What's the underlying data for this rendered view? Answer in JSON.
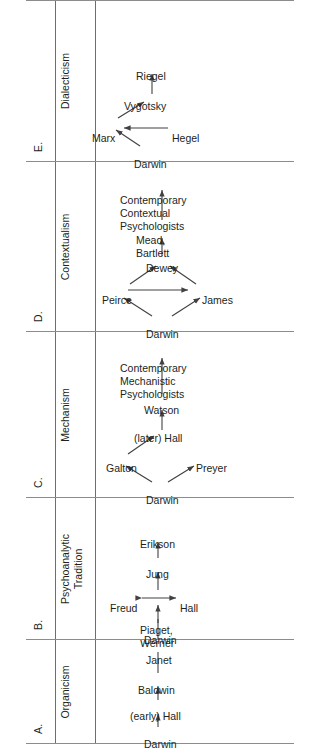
{
  "figure": {
    "kind": "lineage-diagram-table",
    "orientation": "rotated-90-ccw",
    "sections": [
      {
        "letter": "A.",
        "worldview": "Organicism",
        "nodes": [
          "Darwin",
          "(early) Hall",
          "Baldwin",
          "Janet",
          "Piaget,\nWerner"
        ],
        "edges": [
          {
            "from": "Darwin",
            "to": "(early) Hall",
            "style": "arrow"
          },
          {
            "from": "(early) Hall",
            "to": "Baldwin",
            "style": "arrow"
          },
          {
            "from": "Baldwin",
            "to": "Janet",
            "style": "line"
          },
          {
            "from": "Janet",
            "to": "Piaget, Werner",
            "style": "line"
          }
        ]
      },
      {
        "letter": "B.",
        "worldview": "Psychoanalytic\nTradition",
        "nodes": [
          "Darwin",
          "Hall",
          "Freud",
          "Jung",
          "Erikson"
        ],
        "edges": [
          {
            "from": "Darwin",
            "to": "Hall/Freud",
            "style": "arrow"
          },
          {
            "from": "Hall",
            "to": "Freud",
            "style": "double-arrow"
          },
          {
            "from": "Hall/Freud",
            "to": "Jung",
            "style": "arrow"
          },
          {
            "from": "Jung",
            "to": "Erikson",
            "style": "arrow"
          }
        ]
      },
      {
        "letter": "C.",
        "worldview": "Mechanism",
        "nodes": [
          "Darwin",
          "Galton",
          "Preyer",
          "(later) Hall",
          "Watson",
          "Contemporary\nMechanistic\nPsychologists"
        ],
        "edges": [
          {
            "from": "Darwin",
            "to": "Galton",
            "style": "arrow"
          },
          {
            "from": "Darwin",
            "to": "Preyer",
            "style": "arrow"
          },
          {
            "from": "Galton",
            "to": "(later) Hall",
            "style": "arrow"
          },
          {
            "from": "(later) Hall",
            "to": "Watson",
            "style": "arrow"
          },
          {
            "from": "Watson",
            "to": "Contemporary Mechanistic Psychologists",
            "style": "arrow"
          }
        ]
      },
      {
        "letter": "D.",
        "worldview": "Contextualism",
        "nodes": [
          "Darwin",
          "Peirce",
          "James",
          "Dewey",
          "Mead,\nBartlett",
          "Contemporary\nContextual\nPsychologists"
        ],
        "edges": [
          {
            "from": "Darwin",
            "to": "Peirce",
            "style": "arrow"
          },
          {
            "from": "Darwin",
            "to": "James",
            "style": "arrow"
          },
          {
            "from": "Peirce",
            "to": "James",
            "style": "arrow"
          },
          {
            "from": "Peirce",
            "to": "Dewey",
            "style": "arrow"
          },
          {
            "from": "James",
            "to": "Dewey",
            "style": "arrow"
          },
          {
            "from": "Dewey",
            "to": "Mead, Bartlett",
            "style": "arrow"
          },
          {
            "from": "Mead, Bartlett",
            "to": "Contemporary Contextual Psychologists",
            "style": "arrow"
          }
        ]
      },
      {
        "letter": "E.",
        "worldview": "Dialecticism",
        "nodes": [
          "Darwin",
          "Hegel",
          "Marx",
          "Vygotsky",
          "Riegel"
        ],
        "edges": [
          {
            "from": "Darwin",
            "to": "Marx",
            "style": "arrow"
          },
          {
            "from": "Hegel",
            "to": "Marx",
            "style": "arrow"
          },
          {
            "from": "Marx",
            "to": "Vygotsky",
            "style": "arrow"
          },
          {
            "from": "Vygotsky",
            "to": "Riegel",
            "style": "arrow"
          }
        ]
      }
    ]
  },
  "labels": {
    "a_letter": "A.",
    "a_worldview": "Organicism",
    "a_darwin": "Darwin",
    "a_early_hall": "(early) Hall",
    "a_baldwin": "Baldwin",
    "a_janet": "Janet",
    "a_piaget_werner_l1": "Piaget,",
    "a_piaget_werner_l2": "Werner",
    "b_letter": "B.",
    "b_worldview_l1": "Psychoanalytic",
    "b_worldview_l2": "Tradition",
    "b_darwin": "Darwin",
    "b_hall": "Hall",
    "b_freud": "Freud",
    "b_jung": "Jung",
    "b_erikson": "Erikson",
    "c_letter": "C.",
    "c_worldview": "Mechanism",
    "c_darwin": "Darwin",
    "c_galton": "Galton",
    "c_preyer": "Preyer",
    "c_later_hall": "(later) Hall",
    "c_watson": "Watson",
    "c_contemp_l1": "Contemporary",
    "c_contemp_l2": "Mechanistic",
    "c_contemp_l3": "Psychologists",
    "d_letter": "D.",
    "d_worldview": "Contextualism",
    "d_darwin": "Darwin",
    "d_peirce": "Peirce",
    "d_james": "James",
    "d_dewey": "Dewey",
    "d_mead_l1": "Mead,",
    "d_mead_l2": "Bartlett",
    "d_contemp_l1": "Contemporary",
    "d_contemp_l2": "Contextual",
    "d_contemp_l3": "Psychologists",
    "e_letter": "E.",
    "e_worldview": "Dialecticism",
    "e_darwin": "Darwin",
    "e_hegel": "Hegel",
    "e_marx": "Marx",
    "e_vygotsky": "Vygotsky",
    "e_riegel": "Riegel"
  },
  "colors": {
    "ink": "#231f20",
    "rule": "#6d6e71",
    "edge": "#414042",
    "background": "#ffffff"
  }
}
